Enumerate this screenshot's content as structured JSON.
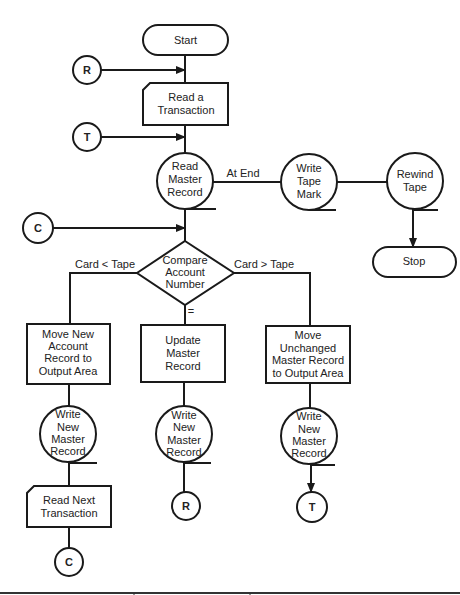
{
  "diagram": {
    "type": "flowchart",
    "nodes": {
      "start": {
        "label": "Start"
      },
      "read_transaction": {
        "lines": [
          "Read a",
          "Transaction"
        ]
      },
      "read_master": {
        "lines": [
          "Read",
          "Master",
          "Record"
        ]
      },
      "write_tape_mark": {
        "lines": [
          "Write",
          "Tape",
          "Mark"
        ]
      },
      "rewind_tape": {
        "lines": [
          "Rewind",
          "Tape"
        ]
      },
      "stop": {
        "label": "Stop"
      },
      "compare": {
        "lines": [
          "Compare",
          "Account",
          "Number"
        ]
      },
      "move_new": {
        "lines": [
          "Move New",
          "Account",
          "Record to",
          "Output Area"
        ]
      },
      "update_master": {
        "lines": [
          "Update",
          "Master",
          "Record"
        ]
      },
      "move_unchanged": {
        "lines": [
          "Move",
          "Unchanged",
          "Master Record",
          "to Output Area"
        ]
      },
      "write_new_1": {
        "lines": [
          "Write",
          "New",
          "Master",
          "Record"
        ]
      },
      "write_new_2": {
        "lines": [
          "Write",
          "New",
          "Master",
          "Record"
        ]
      },
      "write_new_3": {
        "lines": [
          "Write",
          "New",
          "Master",
          "Record"
        ]
      },
      "read_next": {
        "lines": [
          "Read Next",
          "Transaction"
        ]
      }
    },
    "connectors": {
      "r_in": "R",
      "t_in": "T",
      "c_in": "C",
      "c_out": "C",
      "r_out": "R",
      "t_out": "T"
    },
    "edge_labels": {
      "at_end": "At End",
      "card_lt_tape": "Card < Tape",
      "card_gt_tape": "Card > Tape",
      "equal": "="
    }
  }
}
